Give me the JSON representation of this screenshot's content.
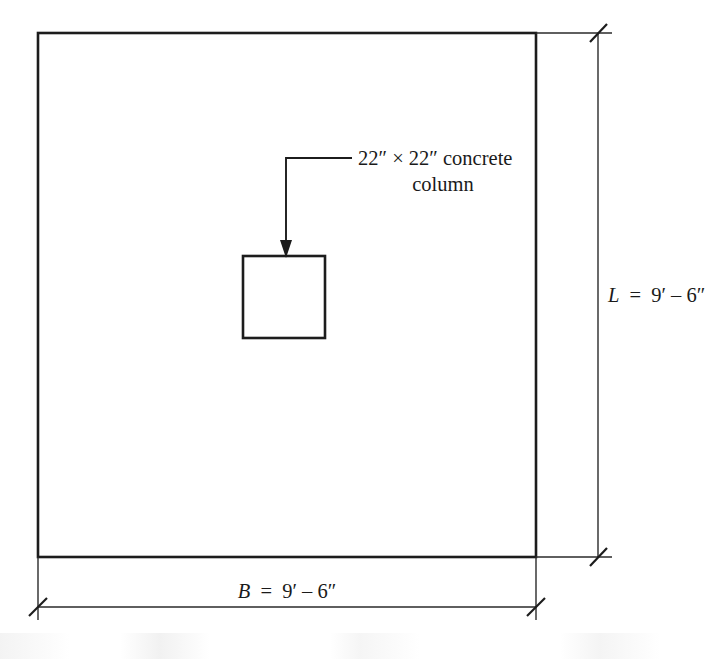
{
  "figure": {
    "type": "engineering-plan-view",
    "callout": {
      "line1": "22″ × 22″ concrete",
      "line2": "column"
    },
    "dimensions": {
      "vertical": {
        "symbol": "L",
        "equals": "=",
        "value": "9′ – 6″",
        "full": "L = 9′ – 6″",
        "orientation": "right-side"
      },
      "horizontal": {
        "symbol": "B",
        "equals": "=",
        "value": "9′ – 6″",
        "full": "B = 9′ – 6″",
        "orientation": "bottom"
      }
    },
    "colors": {
      "ink": "#1c1c1c",
      "line": "#2a2a2a",
      "paper": "#ffffff"
    }
  }
}
